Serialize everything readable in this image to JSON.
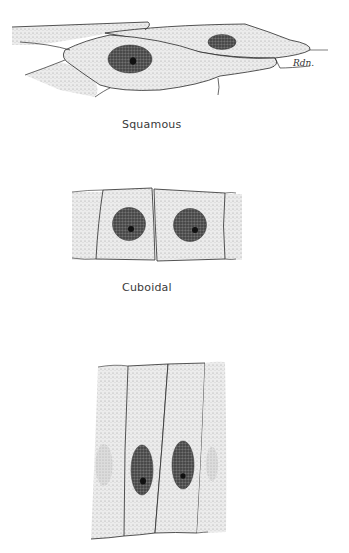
{
  "figure": {
    "panels": [
      {
        "id": "squamous",
        "label": "Squamous",
        "signature": "Rdn."
      },
      {
        "id": "cuboidal",
        "label": "Cuboidal"
      },
      {
        "id": "columnar",
        "label": ""
      }
    ],
    "colors": {
      "background": "#ffffff",
      "cytoplasm_stipple": "#d9d9d9",
      "outline": "#2a2a2a",
      "nucleus": "#4a4a4a",
      "nucleolus": "#111111",
      "faint_nucleus": "#c4c4c4",
      "label_text": "#3a3a3a"
    }
  }
}
